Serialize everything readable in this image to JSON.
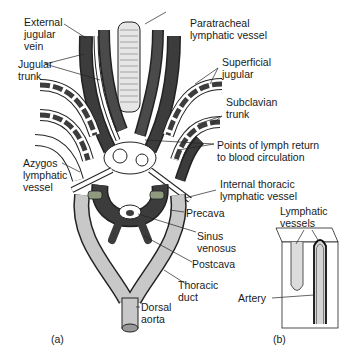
{
  "figure": {
    "panel_a": {
      "caption": "(a)",
      "labels": {
        "external_jugular_vein": [
          "External",
          "jugular",
          "vein"
        ],
        "jugular_trunk": [
          "Jugular",
          "trunk"
        ],
        "azygos_lymphatic_vessel": [
          "Azygos",
          "lymphatic",
          "vessel"
        ],
        "paratracheal_lymphatic_vessel": [
          "Paratracheal",
          "lymphatic vessel"
        ],
        "superficial_jugular": [
          "Superficial",
          "jugular"
        ],
        "subclavian_trunk": [
          "Subclavian",
          "trunk"
        ],
        "points_of_lymph_return": [
          "Points of lymph return",
          "to blood circulation"
        ],
        "internal_thoracic_lymphatic_vessel": [
          "Internal thoracic",
          "lymphatic vessel"
        ],
        "precava": [
          "Precava"
        ],
        "sinus_venosus": [
          "Sinus",
          "venosus"
        ],
        "postcava": [
          "Postcava"
        ],
        "thoracic_duct": [
          "Thoracic",
          "duct"
        ],
        "dorsal_aorta": [
          "Dorsal",
          "aorta"
        ]
      }
    },
    "panel_b": {
      "caption": "(b)",
      "labels": {
        "lymphatic_vessels": [
          "Lymphatic",
          "vessels"
        ],
        "artery": [
          "Artery"
        ]
      }
    },
    "colors": {
      "vein_dark": "#3c3c3c",
      "lymph_light": "#c8c8c8",
      "outline": "#222222",
      "background": "#ffffff"
    }
  }
}
